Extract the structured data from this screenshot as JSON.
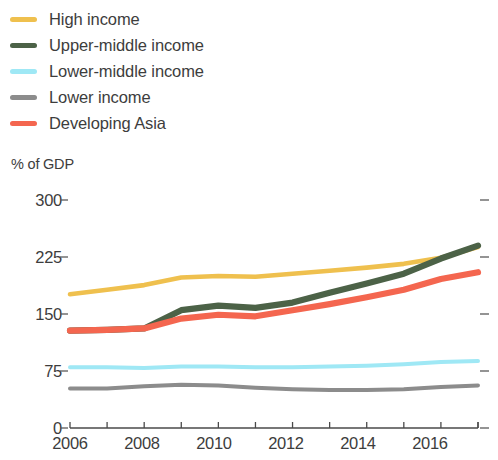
{
  "legend": {
    "items": [
      {
        "label": "High income",
        "color": "#efc04e",
        "key": "high_income"
      },
      {
        "label": "Upper-middle income",
        "color": "#4c6247",
        "key": "upper_middle_income"
      },
      {
        "label": "Lower-middle income",
        "color": "#9fe8f5",
        "key": "lower_middle_income"
      },
      {
        "label": "Lower income",
        "color": "#8c8c8c",
        "key": "lower_income"
      },
      {
        "label": "Developing Asia",
        "color": "#f4664f",
        "key": "developing_asia"
      }
    ]
  },
  "axis": {
    "y_title": "% of GDP",
    "y_ticks": [
      "300",
      "225",
      "150",
      "75",
      "0"
    ],
    "x_ticks": [
      "2006",
      "2008",
      "2010",
      "2012",
      "2014",
      "2016"
    ]
  },
  "chart_data": {
    "type": "line",
    "title": "",
    "xlabel": "",
    "ylabel": "% of GDP",
    "ylim": [
      0,
      300
    ],
    "xlim": [
      2006,
      2017
    ],
    "grid": false,
    "legend_position": "top-left",
    "y_tick_values": [
      0,
      75,
      150,
      225,
      300
    ],
    "x_tick_values": [
      2006,
      2008,
      2010,
      2012,
      2014,
      2016
    ],
    "x": [
      2006,
      2007,
      2008,
      2009,
      2010,
      2011,
      2012,
      2013,
      2014,
      2015,
      2016,
      2017
    ],
    "series": [
      {
        "name": "High income",
        "color": "#efc04e",
        "values": [
          176,
          182,
          188,
          198,
          200,
          199,
          203,
          207,
          211,
          216,
          224,
          238
        ]
      },
      {
        "name": "Upper-middle income",
        "color": "#4c6247",
        "values": [
          128,
          129,
          131,
          155,
          161,
          158,
          165,
          178,
          190,
          203,
          223,
          240
        ]
      },
      {
        "name": "Lower-middle income",
        "color": "#9fe8f5",
        "values": [
          80,
          80,
          79,
          81,
          81,
          80,
          80,
          81,
          82,
          84,
          87,
          88
        ]
      },
      {
        "name": "Lower income",
        "color": "#8c8c8c",
        "values": [
          52,
          52,
          55,
          57,
          56,
          53,
          51,
          50,
          50,
          51,
          54,
          56
        ]
      },
      {
        "name": "Developing Asia",
        "color": "#f4664f",
        "values": [
          128,
          129,
          131,
          144,
          149,
          147,
          155,
          163,
          172,
          182,
          196,
          205
        ]
      }
    ]
  }
}
